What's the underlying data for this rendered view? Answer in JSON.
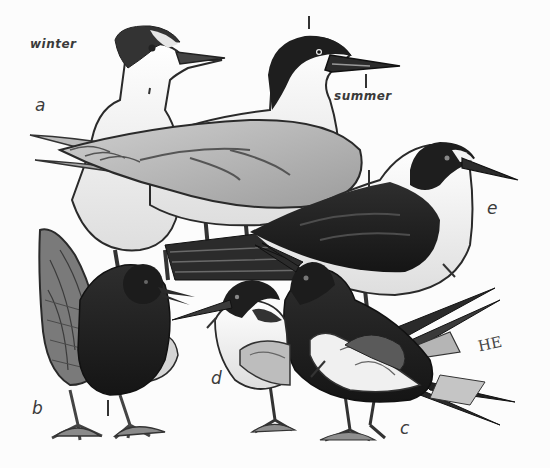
{
  "figure": {
    "season_labels": {
      "winter": "winter",
      "summer": "summer"
    },
    "specimen_letters": [
      "a",
      "b",
      "c",
      "d",
      "e"
    ],
    "signature": "HE",
    "birds": [
      {
        "letter": "a",
        "plumage": "winter",
        "role": "pale tern, dark rear crown, standing behind"
      },
      {
        "letter": "a",
        "plumage": "summer",
        "role": "pale tern, full black cap, standing center"
      },
      {
        "letter": "b",
        "plumage": "summer",
        "role": "dark-bodied tern with raised wing, standing left"
      },
      {
        "letter": "c",
        "plumage": "summer",
        "role": "dark-backed tern with long forked tail, front right"
      },
      {
        "letter": "d",
        "plumage": "summer",
        "role": "small tern with black cap, front center"
      },
      {
        "letter": "e",
        "plumage": "summer",
        "role": "sooty-backed tern with white forehead, right"
      }
    ],
    "colors": {
      "background": "#fcfcfc",
      "ink": "#1e1e1e",
      "dark_plumage": "#242424",
      "mid_grey": "#8a8a8a",
      "light_grey": "#d4d4d4"
    }
  }
}
